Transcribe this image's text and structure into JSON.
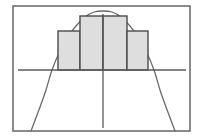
{
  "figure": {
    "title": "Riemann sum approximation of area under a downward parabola",
    "background_color": "#ffffff",
    "frame": {
      "name": "plot-frame",
      "x": 13,
      "y": 6,
      "width": 177,
      "height": 125,
      "stroke_color": "#6e6e6e",
      "stroke_width": 1.6,
      "fill": "none"
    }
  },
  "chart_data": {
    "type": "area",
    "title": "Riemann sum approximation of area under a downward parabola",
    "subtitle": "",
    "xlabel": "",
    "ylabel": "",
    "grid": false,
    "legend": null,
    "axes": {
      "x_axis": {
        "name": "x-axis",
        "orientation": "horizontal",
        "pixel_y": 70,
        "x_start": 18,
        "x_end": 186,
        "stroke_color": "#5a5a5a",
        "stroke_width": 1.3
      },
      "y_axis": {
        "name": "y-axis",
        "orientation": "vertical",
        "pixel_x": 103,
        "y_start": 14,
        "y_end": 128,
        "stroke_color": "#5a5a5a",
        "stroke_width": 1.3
      }
    },
    "curve": {
      "name": "parabola",
      "equation": "y = -(x^2) opening downward",
      "vertex": {
        "x": 103,
        "y": 11
      },
      "x_intercepts_px": [
        52,
        154
      ],
      "stroke_color": "#6a6a6a",
      "stroke_width": 1.3,
      "fill": "none",
      "points_px": [
        {
          "x": 31,
          "y": 131
        },
        {
          "x": 40,
          "y": 107
        },
        {
          "x": 46,
          "y": 90
        },
        {
          "x": 52,
          "y": 70
        },
        {
          "x": 60,
          "y": 51
        },
        {
          "x": 68,
          "y": 37
        },
        {
          "x": 76,
          "y": 26
        },
        {
          "x": 85,
          "y": 17
        },
        {
          "x": 94,
          "y": 12
        },
        {
          "x": 103,
          "y": 11
        },
        {
          "x": 112,
          "y": 12
        },
        {
          "x": 121,
          "y": 17
        },
        {
          "x": 130,
          "y": 26
        },
        {
          "x": 138,
          "y": 37
        },
        {
          "x": 146,
          "y": 51
        },
        {
          "x": 154,
          "y": 70
        },
        {
          "x": 160,
          "y": 90
        },
        {
          "x": 166,
          "y": 107
        },
        {
          "x": 175,
          "y": 131
        }
      ]
    },
    "rectangles": {
      "count": 4,
      "fill_color": "#dedede",
      "stroke_color": "#4a4a4a",
      "stroke_width": 1.4,
      "baseline_y": 70,
      "items": [
        {
          "name": "rect-1-outer-left",
          "x": 58,
          "y": 31,
          "width": 22,
          "height": 39
        },
        {
          "name": "rect-2-inner-left",
          "x": 80,
          "y": 16,
          "width": 23,
          "height": 54
        },
        {
          "name": "rect-3-inner-right",
          "x": 103,
          "y": 16,
          "width": 24,
          "height": 54
        },
        {
          "name": "rect-4-outer-right",
          "x": 127,
          "y": 31,
          "width": 21,
          "height": 39
        }
      ]
    },
    "categories": [
      "rect-1",
      "rect-2",
      "rect-3",
      "rect-4"
    ],
    "values": [
      39,
      54,
      54,
      39
    ],
    "xlim": [
      13,
      190
    ],
    "ylim": [
      6,
      131
    ]
  }
}
